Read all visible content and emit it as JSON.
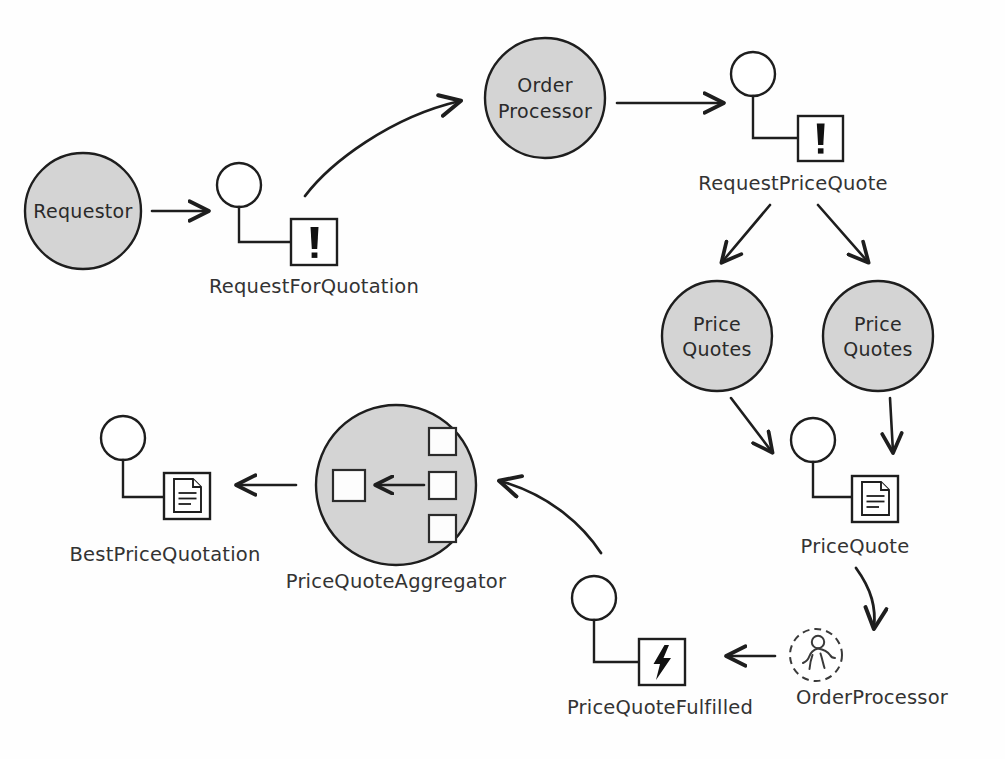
{
  "diagram": {
    "style": {
      "background": "#fefefe",
      "node_fill": "#d4d4d4",
      "node_stroke": "#1e1e1e",
      "icon_fill": "#ffffff",
      "text_color": "#2a2a2a",
      "caption_color": "#333333"
    },
    "participants": [
      {
        "id": "requestor",
        "label": "Requestor",
        "shape": "filled-circle"
      },
      {
        "id": "order-processor",
        "label_line1": "Order",
        "label_line2": "Processor",
        "shape": "filled-circle"
      },
      {
        "id": "price-quotes-left",
        "label_line1": "Price",
        "label_line2": "Quotes",
        "shape": "filled-circle"
      },
      {
        "id": "price-quotes-right",
        "label_line1": "Price",
        "label_line2": "Quotes",
        "shape": "filled-circle"
      },
      {
        "id": "price-quote-aggregator",
        "label": "PriceQuoteAggregator",
        "shape": "filled-circle-aggregator"
      },
      {
        "id": "order-processor-saga",
        "label": "OrderProcessor",
        "shape": "dashed-circle-person"
      }
    ],
    "messages": [
      {
        "id": "request-for-quotation",
        "label": "RequestForQuotation",
        "icon": "command-exclamation-icon",
        "kind": "command"
      },
      {
        "id": "request-price-quote",
        "label": "RequestPriceQuote",
        "icon": "command-exclamation-icon",
        "kind": "command"
      },
      {
        "id": "price-quote",
        "label": "PriceQuote",
        "icon": "document-icon",
        "kind": "document"
      },
      {
        "id": "price-quote-fulfilled",
        "label": "PriceQuoteFulfilled",
        "icon": "lightning-bolt-icon",
        "kind": "event"
      },
      {
        "id": "best-price-quotation",
        "label": "BestPriceQuotation",
        "icon": "document-icon",
        "kind": "document"
      }
    ],
    "captions": {
      "request_for_quotation": "RequestForQuotation",
      "request_price_quote": "RequestPriceQuote",
      "price_quote": "PriceQuote",
      "order_processor_saga": "OrderProcessor",
      "price_quote_fulfilled": "PriceQuoteFulfilled",
      "best_price_quotation": "BestPriceQuotation",
      "price_quote_aggregator": "PriceQuoteAggregator"
    },
    "node_labels": {
      "requestor": "Requestor",
      "order_processor_l1": "Order",
      "order_processor_l2": "Processor",
      "price_quotes_left_l1": "Price",
      "price_quotes_left_l2": "Quotes",
      "price_quotes_right_l1": "Price",
      "price_quotes_right_l2": "Quotes"
    },
    "edges": [
      {
        "id": "requestor-to-rfq",
        "from": "requestor",
        "to": "request-for-quotation",
        "style": "straight"
      },
      {
        "id": "rfq-to-order-processor",
        "from": "request-for-quotation",
        "to": "order-processor",
        "style": "curved"
      },
      {
        "id": "order-processor-to-rpq",
        "from": "order-processor",
        "to": "request-price-quote",
        "style": "straight"
      },
      {
        "id": "rpq-to-price-quotes-left",
        "from": "request-price-quote",
        "to": "price-quotes-left",
        "style": "straight"
      },
      {
        "id": "rpq-to-price-quotes-right",
        "from": "request-price-quote",
        "to": "price-quotes-right",
        "style": "straight"
      },
      {
        "id": "price-quotes-left-to-pq",
        "from": "price-quotes-left",
        "to": "price-quote",
        "style": "straight"
      },
      {
        "id": "price-quotes-right-to-pq",
        "from": "price-quotes-right",
        "to": "price-quote",
        "style": "straight"
      },
      {
        "id": "pq-to-saga",
        "from": "price-quote",
        "to": "order-processor-saga",
        "style": "curved"
      },
      {
        "id": "saga-to-pqf",
        "from": "order-processor-saga",
        "to": "price-quote-fulfilled",
        "style": "straight"
      },
      {
        "id": "pqf-to-aggregator",
        "from": "price-quote-fulfilled",
        "to": "price-quote-aggregator",
        "style": "curved"
      },
      {
        "id": "aggregator-to-bpq",
        "from": "price-quote-aggregator",
        "to": "best-price-quotation",
        "style": "straight"
      }
    ]
  }
}
